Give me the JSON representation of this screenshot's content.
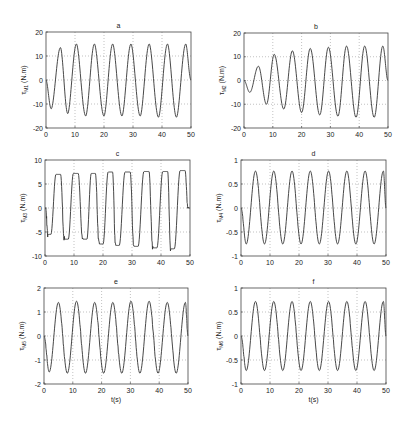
{
  "figure": {
    "background": "#ffffff",
    "line_color": "#333333",
    "grid_color": "#999999",
    "axis_color": "#444444"
  },
  "chart_data": [
    {
      "id": "a",
      "type": "line",
      "title": "a",
      "ylabel_symbol": "τ",
      "ylabel_sub": "M1",
      "ylabel_unit": "(N.m)",
      "xlabel": "",
      "xlim": [
        0,
        50
      ],
      "ylim": [
        -20,
        20
      ],
      "xticks": [
        0,
        10,
        20,
        30,
        40,
        50
      ],
      "yticks": [
        -20,
        -10,
        0,
        10,
        20
      ],
      "grid": true,
      "box": [
        46,
        32,
        191,
        128
      ],
      "signal": {
        "period": 6.3,
        "amp_start": 12,
        "amp_end": 15,
        "ramp_time": 8,
        "phase": -0.3,
        "shape": "clipped",
        "noise": 0
      },
      "peaks": [
        {
          "t": 5,
          "v": 13.5
        },
        {
          "t": 10.5,
          "v": 15
        },
        {
          "t": 16.7,
          "v": 15
        },
        {
          "t": 23,
          "v": 15
        },
        {
          "t": 29.3,
          "v": 15
        },
        {
          "t": 35.6,
          "v": 15
        },
        {
          "t": 41.9,
          "v": 15
        },
        {
          "t": 48.2,
          "v": 15
        }
      ],
      "troughs": [
        {
          "t": 1.8,
          "v": -12
        },
        {
          "t": 7.5,
          "v": -14
        },
        {
          "t": 13.7,
          "v": -15
        },
        {
          "t": 20,
          "v": -15
        },
        {
          "t": 26.2,
          "v": -15
        },
        {
          "t": 32.5,
          "v": -15
        },
        {
          "t": 38.8,
          "v": -15.5
        },
        {
          "t": 45,
          "v": -15.5
        }
      ]
    },
    {
      "id": "b",
      "type": "line",
      "title": "b",
      "ylabel_symbol": "τ",
      "ylabel_sub": "M2",
      "ylabel_unit": "(N.m)",
      "xlabel": "",
      "xlim": [
        0,
        50
      ],
      "ylim": [
        -20,
        20
      ],
      "xticks": [
        0,
        10,
        20,
        30,
        40,
        50
      ],
      "yticks": [
        -20,
        -10,
        0,
        10,
        20
      ],
      "grid": true,
      "box": [
        244,
        33,
        388,
        128
      ],
      "signal": {
        "period": 6.3,
        "amp_start": 4,
        "amp_end": 15,
        "ramp_time": 30,
        "phase": 0.4,
        "shape": "sine",
        "noise": 0
      },
      "peaks": [
        {
          "t": 5,
          "v": 6
        },
        {
          "t": 10.5,
          "v": 11
        },
        {
          "t": 16.8,
          "v": 12.5
        },
        {
          "t": 23,
          "v": 13.5
        },
        {
          "t": 29.3,
          "v": 14
        },
        {
          "t": 35.6,
          "v": 14.5
        },
        {
          "t": 41.9,
          "v": 14.5
        },
        {
          "t": 48.2,
          "v": 14.5
        }
      ],
      "troughs": [
        {
          "t": 2,
          "v": -5
        },
        {
          "t": 7.8,
          "v": -10
        },
        {
          "t": 13.8,
          "v": -12
        },
        {
          "t": 20,
          "v": -13.5
        },
        {
          "t": 26.3,
          "v": -14.5
        },
        {
          "t": 32.6,
          "v": -15
        },
        {
          "t": 38.9,
          "v": -15.5
        },
        {
          "t": 45.2,
          "v": -15.5
        }
      ]
    },
    {
      "id": "c",
      "type": "line",
      "title": "c",
      "ylabel_symbol": "τ",
      "ylabel_sub": "M3",
      "ylabel_unit": "(N.m)",
      "xlabel": "",
      "xlim": [
        0,
        50
      ],
      "ylim": [
        -10,
        10
      ],
      "xticks": [
        0,
        10,
        20,
        30,
        40,
        50
      ],
      "yticks": [
        -10,
        -5,
        0,
        5,
        10
      ],
      "grid": true,
      "box": [
        45,
        160,
        190,
        256
      ],
      "signal": {
        "period": 6.3,
        "amp_start": 6,
        "amp_end": 7.8,
        "ramp_time": 30,
        "phase": -0.3,
        "shape": "square",
        "noise": 0.15
      },
      "peaks": [
        {
          "t": 5,
          "v": 7
        },
        {
          "t": 11,
          "v": 7.2
        },
        {
          "t": 17,
          "v": 7.2
        },
        {
          "t": 23,
          "v": 7.5
        },
        {
          "t": 29,
          "v": 7.5
        },
        {
          "t": 35.5,
          "v": 7.6
        },
        {
          "t": 42,
          "v": 7.6
        },
        {
          "t": 48,
          "v": 7.8
        }
      ],
      "troughs": [
        {
          "t": 1.5,
          "v": -5.5
        },
        {
          "t": 7.5,
          "v": -6.5
        },
        {
          "t": 14,
          "v": -6.5
        },
        {
          "t": 19.5,
          "v": -7.5
        },
        {
          "t": 25,
          "v": -7.8
        },
        {
          "t": 31.5,
          "v": -8
        },
        {
          "t": 38,
          "v": -8.3
        },
        {
          "t": 44,
          "v": -8.5
        }
      ]
    },
    {
      "id": "d",
      "type": "line",
      "title": "d",
      "ylabel_symbol": "τ",
      "ylabel_sub": "M4",
      "ylabel_unit": "(N.m)",
      "xlabel": "",
      "xlim": [
        0,
        50
      ],
      "ylim": [
        -1,
        1
      ],
      "xticks": [
        0,
        10,
        20,
        30,
        40,
        50
      ],
      "yticks": [
        -1,
        -0.5,
        0,
        0.5,
        1
      ],
      "grid": true,
      "box": [
        241,
        160,
        386,
        256
      ],
      "signal": {
        "period": 6.3,
        "amp_start": 0.75,
        "amp_end": 0.77,
        "ramp_time": 5,
        "phase": 0.5,
        "shape": "sine",
        "noise": 0.04
      },
      "peaks": [
        {
          "t": 5,
          "v": 0.77
        },
        {
          "t": 11.3,
          "v": 0.77
        },
        {
          "t": 17.6,
          "v": 0.77
        },
        {
          "t": 23.9,
          "v": 0.77
        },
        {
          "t": 30.2,
          "v": 0.77
        },
        {
          "t": 36.5,
          "v": 0.77
        },
        {
          "t": 42.8,
          "v": 0.77
        },
        {
          "t": 49.1,
          "v": 0.77
        }
      ],
      "troughs": [
        {
          "t": 1.8,
          "v": -0.75
        },
        {
          "t": 8.1,
          "v": -0.75
        },
        {
          "t": 14.4,
          "v": -0.75
        },
        {
          "t": 20.7,
          "v": -0.75
        },
        {
          "t": 27,
          "v": -0.75
        },
        {
          "t": 33.3,
          "v": -0.75
        },
        {
          "t": 39.6,
          "v": -0.75
        },
        {
          "t": 45.9,
          "v": -0.75
        }
      ]
    },
    {
      "id": "e",
      "type": "line",
      "title": "e",
      "ylabel_symbol": "τ",
      "ylabel_sub": "M5",
      "ylabel_unit": "(N.m)",
      "xlabel": "t(s)",
      "xlim": [
        0,
        50
      ],
      "ylim": [
        -2,
        2
      ],
      "xticks": [
        0,
        10,
        20,
        30,
        40,
        50
      ],
      "yticks": [
        -2,
        -1,
        0,
        1,
        2
      ],
      "grid": true,
      "box": [
        44,
        288,
        188,
        384
      ],
      "signal": {
        "period": 6.3,
        "amp_start": 1.45,
        "amp_end": 1.5,
        "ramp_time": 5,
        "phase": 0.5,
        "shape": "sine",
        "noise": 0.08
      },
      "peaks": [
        {
          "t": 5,
          "v": 1.4
        },
        {
          "t": 11.3,
          "v": 1.45
        },
        {
          "t": 17.6,
          "v": 1.4
        },
        {
          "t": 23.9,
          "v": 1.4
        },
        {
          "t": 30.2,
          "v": 1.45
        },
        {
          "t": 36.5,
          "v": 1.45
        },
        {
          "t": 42.8,
          "v": 1.4
        },
        {
          "t": 49.1,
          "v": 1.4
        }
      ],
      "troughs": [
        {
          "t": 1.8,
          "v": -1.5
        },
        {
          "t": 8.1,
          "v": -1.55
        },
        {
          "t": 14.4,
          "v": -1.55
        },
        {
          "t": 20.7,
          "v": -1.55
        },
        {
          "t": 27,
          "v": -1.55
        },
        {
          "t": 33.3,
          "v": -1.55
        },
        {
          "t": 39.6,
          "v": -1.55
        },
        {
          "t": 45.9,
          "v": -1.55
        }
      ]
    },
    {
      "id": "f",
      "type": "line",
      "title": "f",
      "ylabel_symbol": "τ",
      "ylabel_sub": "M6",
      "ylabel_unit": "(N.m)",
      "xlabel": "t(s)",
      "xlim": [
        0,
        50
      ],
      "ylim": [
        -1,
        1
      ],
      "xticks": [
        0,
        10,
        20,
        30,
        40,
        50
      ],
      "yticks": [
        -1,
        -0.5,
        0,
        0.5,
        1
      ],
      "grid": true,
      "box": [
        241,
        288,
        386,
        384
      ],
      "signal": {
        "period": 6.3,
        "amp_start": 0.72,
        "amp_end": 0.72,
        "ramp_time": 5,
        "phase": 0.5,
        "shape": "sine",
        "noise": 0.05
      },
      "peaks": [
        {
          "t": 5,
          "v": 0.72
        },
        {
          "t": 11.3,
          "v": 0.72
        },
        {
          "t": 17.6,
          "v": 0.72
        },
        {
          "t": 23.9,
          "v": 0.72
        },
        {
          "t": 30.2,
          "v": 0.72
        },
        {
          "t": 36.5,
          "v": 0.72
        },
        {
          "t": 42.8,
          "v": 0.72
        },
        {
          "t": 49.1,
          "v": 0.72
        }
      ],
      "troughs": [
        {
          "t": 1.8,
          "v": -0.72
        },
        {
          "t": 8.1,
          "v": -0.72
        },
        {
          "t": 14.4,
          "v": -0.72
        },
        {
          "t": 20.7,
          "v": -0.72
        },
        {
          "t": 27,
          "v": -0.72
        },
        {
          "t": 33.3,
          "v": -0.72
        },
        {
          "t": 39.6,
          "v": -0.72
        },
        {
          "t": 45.9,
          "v": -0.72
        }
      ]
    }
  ]
}
